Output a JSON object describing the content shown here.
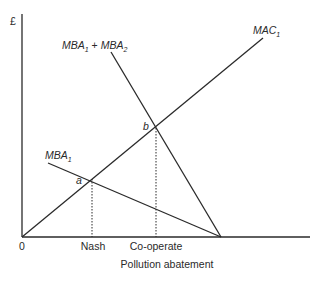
{
  "diagram": {
    "y_axis_label": "£",
    "x_axis_label": "Pollution abatement",
    "origin_label": "0",
    "x_ticks": [
      {
        "label": "Nash"
      },
      {
        "label": "Co-operate"
      }
    ],
    "curves": [
      {
        "name": "MAC",
        "subscript": "1",
        "type": "upward line from origin"
      },
      {
        "name": "MBA",
        "subscript": "1",
        "type": "downward line"
      },
      {
        "name_a": "MBA",
        "sub_a": "1",
        "plus": " + ",
        "name_b": "MBA",
        "sub_b": "2",
        "type": "steep downward line"
      }
    ],
    "points": [
      {
        "label": "a",
        "description": "MAC1 intersects MBA1 (Nash)"
      },
      {
        "label": "b",
        "description": "MAC1 intersects MBA1 + MBA2 (Co-operate)"
      }
    ],
    "colors": {
      "line": "#2a2a2a",
      "background": "#ffffff"
    }
  }
}
